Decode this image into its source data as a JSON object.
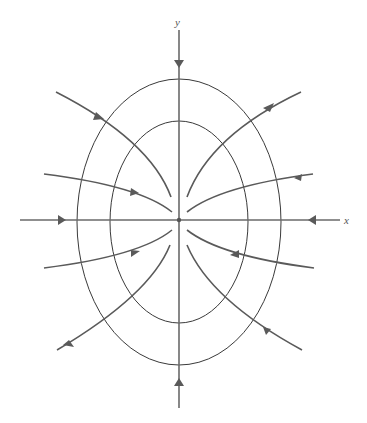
{
  "diagram": {
    "type": "phase-portrait",
    "axes": {
      "x_label": "x",
      "y_label": "y"
    },
    "center": [
      179,
      220
    ],
    "level_curves": [
      {
        "name": "outer-ellipse",
        "rx": 102,
        "ry": 143
      },
      {
        "name": "inner-ellipse",
        "rx": 69,
        "ry": 101
      }
    ],
    "trajectory_count": 10,
    "arrow_direction": "toward-origin",
    "colors": {
      "axis": "#6a6a6a",
      "level_curve": "#3a3a3a",
      "trajectory": "#5a5a5a",
      "background": "#ffffff"
    }
  }
}
